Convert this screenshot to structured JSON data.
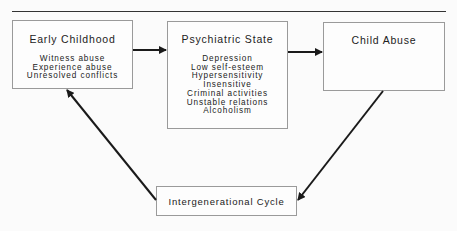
{
  "diagram": {
    "nodes": {
      "early_childhood": {
        "title": "Early Childhood",
        "items": [
          "Witness abuse",
          "Experience abuse",
          "Unresolved conflicts"
        ]
      },
      "psychiatric_state": {
        "title": "Psychiatric State",
        "items": [
          "Depression",
          "Low self-esteem",
          "Hypersensitivity",
          "Insensitive",
          "Criminal activities",
          "Unstable relations",
          "Alcoholism"
        ]
      },
      "child_abuse": {
        "title": "Child Abuse",
        "items": []
      },
      "intergenerational_cycle": {
        "title": "Intergenerational Cycle"
      }
    },
    "edges": [
      {
        "from": "Early Childhood",
        "to": "Psychiatric State"
      },
      {
        "from": "Psychiatric State",
        "to": "Child Abuse"
      },
      {
        "from": "Child Abuse",
        "to": "Intergenerational Cycle"
      },
      {
        "from": "Intergenerational Cycle",
        "to": "Early Childhood"
      }
    ],
    "colors": {
      "line": "#1a1a1a",
      "box_border": "#9a9a9a"
    }
  }
}
